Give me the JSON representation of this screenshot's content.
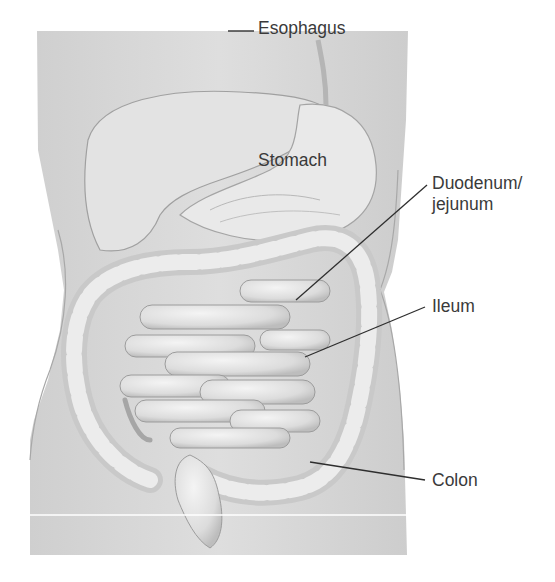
{
  "figure": {
    "colors": {
      "background": "#ffffff",
      "panel": "#d9d9d9",
      "organ_fill": "#e6e6e6",
      "organ_stroke": "#9a9a9a",
      "leader_line": "#2e2e2e",
      "label_text": "#3a3a3a"
    },
    "labels": {
      "esophagus": "Esophagus",
      "stomach": "Stomach",
      "duodenum_line1": "Duodenum/",
      "duodenum_line2": "jejunum",
      "ileum": "Ileum",
      "colon": "Colon"
    }
  }
}
